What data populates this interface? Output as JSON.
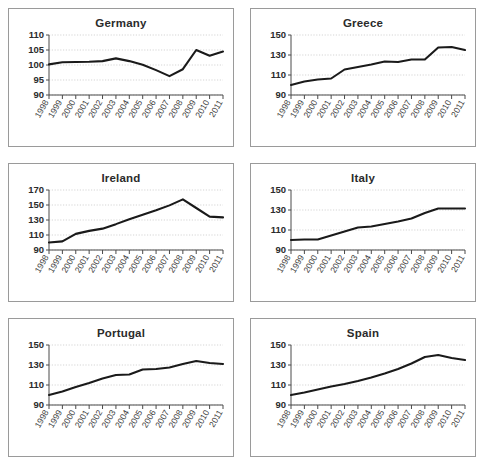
{
  "figure": {
    "panel_border_color": "#9a9a9a",
    "background": "#ffffff",
    "line_color": "#1a1a1a",
    "grid_color": "#b8b8b8",
    "axis_color": "#4a4a4a",
    "title_color": "#2b2b2b"
  },
  "chart_data": [
    {
      "type": "line",
      "title": "Germany",
      "xlabel": "",
      "ylabel": "",
      "x": [
        "1998",
        "1999",
        "2000",
        "2001",
        "2002",
        "2003",
        "2004",
        "2005",
        "2006",
        "2007",
        "2008",
        "2009",
        "2010",
        "2011"
      ],
      "values": [
        100.2,
        100.9,
        101.0,
        101.1,
        101.3,
        102.2,
        101.3,
        100.1,
        98.3,
        96.3,
        98.6,
        105.0,
        103.1,
        104.5
      ],
      "ylim": [
        90,
        110
      ],
      "yticks": [
        90,
        95,
        100,
        105,
        110
      ],
      "grid": true,
      "legend": "none"
    },
    {
      "type": "line",
      "title": "Greece",
      "xlabel": "",
      "ylabel": "",
      "x": [
        "1998",
        "1999",
        "2000",
        "2001",
        "2002",
        "2003",
        "2004",
        "2005",
        "2006",
        "2007",
        "2008",
        "2009",
        "2010",
        "2011"
      ],
      "values": [
        100.0,
        103.5,
        105.5,
        106.5,
        115.5,
        118.0,
        120.5,
        123.5,
        123.0,
        125.5,
        125.5,
        137.5,
        138.0,
        135.0
      ],
      "ylim": [
        90,
        150
      ],
      "yticks": [
        90,
        110,
        130,
        150
      ],
      "grid": true,
      "legend": "none"
    },
    {
      "type": "line",
      "title": "Ireland",
      "xlabel": "",
      "ylabel": "",
      "x": [
        "1998",
        "1999",
        "2000",
        "2001",
        "2002",
        "2003",
        "2004",
        "2005",
        "2006",
        "2007",
        "2008",
        "2009",
        "2010",
        "2011"
      ],
      "values": [
        100.0,
        101.5,
        111.5,
        115.5,
        118.5,
        124.5,
        131.0,
        137.0,
        143.0,
        149.5,
        157.5,
        146.0,
        134.5,
        133.5
      ],
      "ylim": [
        90,
        170
      ],
      "yticks": [
        90,
        110,
        130,
        150,
        170
      ],
      "grid": true,
      "legend": "none"
    },
    {
      "type": "line",
      "title": "Italy",
      "xlabel": "",
      "ylabel": "",
      "x": [
        "1998",
        "1999",
        "2000",
        "2001",
        "2002",
        "2003",
        "2004",
        "2005",
        "2006",
        "2007",
        "2008",
        "2009",
        "2010",
        "2011"
      ],
      "values": [
        100.0,
        100.5,
        100.5,
        104.5,
        108.5,
        112.5,
        113.5,
        116.0,
        118.5,
        121.5,
        127.0,
        131.5,
        131.5,
        131.5
      ],
      "ylim": [
        90,
        150
      ],
      "yticks": [
        90,
        110,
        130,
        150
      ],
      "grid": true,
      "legend": "none"
    },
    {
      "type": "line",
      "title": "Portugal",
      "xlabel": "",
      "ylabel": "",
      "x": [
        "1998",
        "1999",
        "2000",
        "2001",
        "2002",
        "2003",
        "2004",
        "2005",
        "2006",
        "2007",
        "2008",
        "2009",
        "2010",
        "2011"
      ],
      "values": [
        100.0,
        103.5,
        108.0,
        112.0,
        116.5,
        120.0,
        120.5,
        125.5,
        126.0,
        127.5,
        131.0,
        134.0,
        132.0,
        131.0
      ],
      "ylim": [
        90,
        150
      ],
      "yticks": [
        90,
        110,
        130,
        150
      ],
      "grid": true,
      "legend": "none"
    },
    {
      "type": "line",
      "title": "Spain",
      "xlabel": "",
      "ylabel": "",
      "x": [
        "1998",
        "1999",
        "2000",
        "2001",
        "2002",
        "2003",
        "2004",
        "2005",
        "2006",
        "2007",
        "2008",
        "2009",
        "2010",
        "2011"
      ],
      "values": [
        100.0,
        102.5,
        105.5,
        108.5,
        111.0,
        114.0,
        117.5,
        121.5,
        126.0,
        131.5,
        138.0,
        140.0,
        137.0,
        135.0
      ],
      "ylim": [
        90,
        150
      ],
      "yticks": [
        90,
        110,
        130,
        150
      ],
      "grid": true,
      "legend": "none"
    }
  ]
}
